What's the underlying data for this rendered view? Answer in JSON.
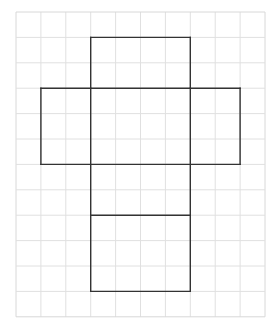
{
  "diagram": {
    "title": "",
    "type": "cube net on square grid",
    "grid": {
      "origin_x": 16,
      "origin_y": 12,
      "cols": 10,
      "rows": 12,
      "cell_w": 24.9,
      "cell_h": 25.4,
      "line_color": "#e0e0e0",
      "border_color": "#d8d8d8"
    },
    "net": {
      "stroke_color": "#333333",
      "stroke_width": 1.4,
      "segments": [
        {
          "name": "top-face-top-edge",
          "from": [
            3,
            1
          ],
          "to": [
            7,
            1
          ]
        },
        {
          "name": "top-face-left-edge",
          "from": [
            3,
            1
          ],
          "to": [
            3,
            3
          ]
        },
        {
          "name": "top-face-right-edge",
          "from": [
            7,
            1
          ],
          "to": [
            7,
            3
          ]
        },
        {
          "name": "middle-row-top-edge",
          "from": [
            1,
            3
          ],
          "to": [
            9,
            3
          ]
        },
        {
          "name": "middle-row-left-edge",
          "from": [
            1,
            3
          ],
          "to": [
            1,
            6
          ]
        },
        {
          "name": "middle-row-right-edge",
          "from": [
            9,
            3
          ],
          "to": [
            9,
            6
          ]
        },
        {
          "name": "middle-row-bottom-edge",
          "from": [
            1,
            6
          ],
          "to": [
            9,
            6
          ]
        },
        {
          "name": "center-left-divider",
          "from": [
            3,
            3
          ],
          "to": [
            3,
            11
          ]
        },
        {
          "name": "center-right-divider",
          "from": [
            7,
            3
          ],
          "to": [
            7,
            11
          ]
        },
        {
          "name": "lower-face-divider",
          "from": [
            3,
            8
          ],
          "to": [
            7,
            8
          ]
        },
        {
          "name": "bottom-face-bottom-edge",
          "from": [
            3,
            11
          ],
          "to": [
            7,
            11
          ]
        }
      ]
    }
  }
}
